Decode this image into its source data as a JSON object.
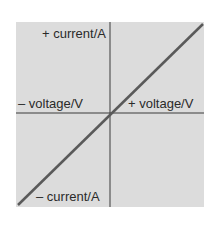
{
  "diagram": {
    "title": "",
    "labels": {
      "y_positive": "+ current/A",
      "y_negative": "– current/A",
      "x_negative": "– voltage/V",
      "x_positive": "+ voltage/V"
    },
    "colors": {
      "background": "#dcdcdc",
      "axes": "#3a3a3a",
      "line": "#5a5a5a"
    },
    "line": {
      "description": "straight line through origin with positive slope (ohmic conductor)"
    }
  }
}
